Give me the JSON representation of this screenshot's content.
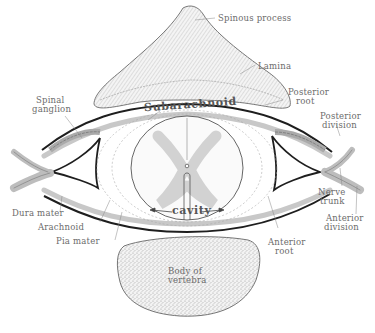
{
  "figure": {
    "labels": {
      "spinous_process": "Spinous process",
      "lamina": "Lamina",
      "spinal_ganglion_1": "Spinal",
      "spinal_ganglion_2": "ganglion",
      "posterior_root_1": "Posterior",
      "posterior_root_2": "root",
      "posterior_division_1": "Posterior",
      "posterior_division_2": "division",
      "subarachnoid": "Subarachnoid",
      "cavity": "cavity",
      "nerve_trunk_1": "Nerve",
      "nerve_trunk_2": "trunk",
      "anterior_division_1": "Anterior",
      "anterior_division_2": "division",
      "dura_mater": "Dura mater",
      "arachnoid": "Arachnoid",
      "pia_mater": "Pia mater",
      "anterior_root_1": "Anterior",
      "anterior_root_2": "root",
      "body_of_vertebra_1": "Body of",
      "body_of_vertebra_2": "vertebra"
    },
    "colors": {
      "line": "#222222",
      "soft_line": "#8a8a8a",
      "fill_bone": "#e9e9e9",
      "grey_matter": "#dcdcdc",
      "text": "#6b6b6b"
    }
  }
}
